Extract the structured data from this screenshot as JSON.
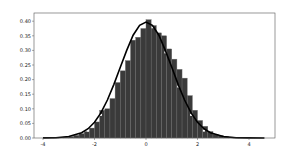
{
  "chart_data": {
    "type": "bar",
    "title": "",
    "xlabel": "",
    "ylabel": "",
    "xlim": [
      -4.1,
      5.25
    ],
    "ylim": [
      0,
      0.43
    ],
    "grid": false,
    "legend": null,
    "x_ticks": [
      "-4",
      "-2",
      "0",
      "2",
      "4"
    ],
    "y_ticks": [
      "0.00",
      "0.05",
      "0.10",
      "0.15",
      "0.20",
      "0.25",
      "0.30",
      "0.35",
      "0.40"
    ],
    "bar_color": "#3a3a3a",
    "curve_color": "#000000",
    "series": [
      {
        "name": "histogram (density)",
        "type": "bar",
        "bin_width": 0.2,
        "bin_starts": [
          -4.0,
          -3.8,
          -3.6,
          -3.4,
          -3.2,
          -3.0,
          -2.8,
          -2.6,
          -2.4,
          -2.2,
          -2.0,
          -1.8,
          -1.6,
          -1.4,
          -1.2,
          -1.0,
          -0.8,
          -0.6,
          -0.4,
          -0.2,
          0.0,
          0.2,
          0.4,
          0.6,
          0.8,
          1.0,
          1.2,
          1.4,
          1.6,
          1.8,
          2.0,
          2.2,
          2.4,
          2.6,
          2.8,
          3.0,
          3.2,
          3.4,
          3.6,
          3.8,
          4.0,
          4.2,
          4.4
        ],
        "values": [
          0.0002,
          0.0005,
          0.001,
          0.002,
          0.003,
          0.005,
          0.009,
          0.015,
          0.022,
          0.034,
          0.055,
          0.095,
          0.1,
          0.135,
          0.19,
          0.23,
          0.265,
          0.335,
          0.345,
          0.375,
          0.405,
          0.385,
          0.36,
          0.35,
          0.305,
          0.27,
          0.235,
          0.205,
          0.145,
          0.095,
          0.06,
          0.04,
          0.022,
          0.013,
          0.008,
          0.005,
          0.003,
          0.002,
          0.001,
          0.0005,
          0.0003,
          0.0002,
          0.0001
        ]
      },
      {
        "name": "KDE curve",
        "type": "line",
        "x": [
          -4.0,
          -3.5,
          -3.0,
          -2.5,
          -2.25,
          -2.0,
          -1.75,
          -1.5,
          -1.25,
          -1.0,
          -0.75,
          -0.5,
          -0.25,
          0.0,
          0.25,
          0.5,
          0.75,
          1.0,
          1.25,
          1.5,
          1.75,
          2.0,
          2.25,
          2.5,
          3.0,
          3.5,
          4.0,
          4.6
        ],
        "values": [
          0.0002,
          0.001,
          0.005,
          0.018,
          0.032,
          0.054,
          0.086,
          0.13,
          0.183,
          0.242,
          0.3,
          0.352,
          0.386,
          0.397,
          0.386,
          0.352,
          0.3,
          0.242,
          0.183,
          0.13,
          0.086,
          0.054,
          0.032,
          0.018,
          0.005,
          0.001,
          0.0002,
          0.0
        ]
      }
    ]
  }
}
